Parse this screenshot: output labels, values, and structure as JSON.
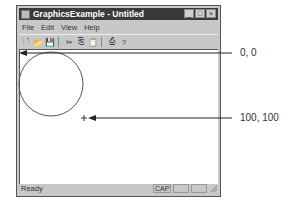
{
  "window": {
    "title": "GraphicsExample - Untitled",
    "controls": {
      "minimize": "_",
      "maximize": "□",
      "close": "×"
    }
  },
  "menubar": {
    "items": [
      {
        "label": "File"
      },
      {
        "label": "Edit"
      },
      {
        "label": "View"
      },
      {
        "label": "Help"
      }
    ]
  },
  "toolbar": {
    "buttons": [
      {
        "icon": "new-file-icon",
        "glyph": "🗋"
      },
      {
        "icon": "open-folder-icon",
        "glyph": "📂"
      },
      {
        "icon": "save-disk-icon",
        "glyph": "💾"
      },
      {
        "icon": "cut-icon",
        "glyph": "✂"
      },
      {
        "icon": "copy-icon",
        "glyph": "⎘"
      },
      {
        "icon": "paste-icon",
        "glyph": "📋"
      },
      {
        "icon": "print-icon",
        "glyph": "⎙"
      },
      {
        "icon": "help-icon",
        "glyph": "?"
      }
    ]
  },
  "canvas": {
    "shapes": [
      {
        "type": "circle",
        "cx": 51,
        "cy": 84,
        "r": 32,
        "stroke": "#555555"
      },
      {
        "type": "crosshair",
        "x": 84,
        "y": 118
      }
    ]
  },
  "statusbar": {
    "text": "Ready",
    "panes": [
      "CAP",
      "",
      ""
    ]
  },
  "annotations": [
    {
      "label": "0, 0",
      "arrow_from": [
        232,
        53
      ],
      "arrow_to": [
        20,
        53
      ]
    },
    {
      "label": "100, 100",
      "arrow_from": [
        232,
        118
      ],
      "arrow_to": [
        88,
        118
      ]
    }
  ],
  "colors": {
    "titlebar": "#3a3a3a",
    "frame": "#c8c8c8",
    "client_bg": "#ffffff"
  }
}
